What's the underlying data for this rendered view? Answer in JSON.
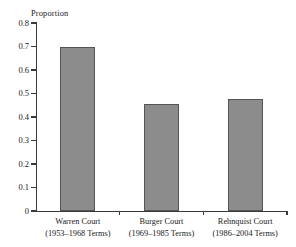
{
  "chart_data": {
    "type": "bar",
    "title": "",
    "xlabel": "",
    "ylabel": "Proportion",
    "ylim": [
      0,
      0.8
    ],
    "grid": false,
    "legend": false,
    "categories": [
      "Warren Court",
      "Burger Court",
      "Rehnquist Court"
    ],
    "category_sublabels": [
      "(1953–1968 Terms)",
      "(1969–1985 Terms)",
      "(1986–2004 Terms)"
    ],
    "values": [
      0.7,
      0.455,
      0.477
    ],
    "ytick_labels": [
      "0.8",
      "0.7",
      "0.6",
      "0.5",
      "0.4",
      "0.3",
      "0.2",
      "0.1",
      "0"
    ],
    "ytick_values": [
      0.8,
      0.7,
      0.6,
      0.5,
      0.4,
      0.3,
      0.2,
      0.1,
      0
    ],
    "bar_color": "#8c8c8c",
    "bar_edge_color": "#555555",
    "axis_color": "#3a3a3a",
    "background_color": "#ffffff"
  }
}
